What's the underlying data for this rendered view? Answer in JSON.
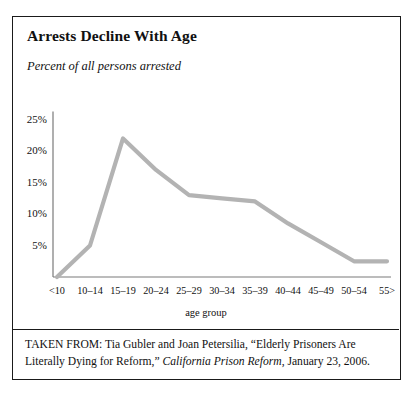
{
  "figure": {
    "title": "Arrests Decline With Age",
    "subtitle": "Percent of all persons arrested",
    "source_prefix": "TAKEN FROM: Tia Gubler and Joan Petersilia, “Elderly Prisoners Are Literally Dying for Reform,” ",
    "source_italic": "California Prison Reform",
    "source_suffix": ", January 23, 2006."
  },
  "chart_data": {
    "type": "line",
    "title": "Arrests Decline With Age",
    "subtitle": "Percent of all persons arrested",
    "xlabel": "age group",
    "ylabel": "",
    "categories": [
      "<10",
      "10–14",
      "15–19",
      "20–24",
      "25–29",
      "30–34",
      "35–39",
      "40–44",
      "45–49",
      "50–54",
      "55>"
    ],
    "values": [
      0,
      5,
      22,
      17,
      13,
      12.5,
      12,
      8.5,
      5.5,
      2.5,
      2.5
    ],
    "ytick_labels": [
      "25%",
      "20%",
      "15%",
      "10%",
      "5%"
    ],
    "ytick_values": [
      25,
      20,
      15,
      10,
      5
    ],
    "ylim": [
      0,
      25
    ],
    "grid": false,
    "legend": false,
    "line_color": "#b3b3b3",
    "axis_color": "#7a7a7a"
  }
}
